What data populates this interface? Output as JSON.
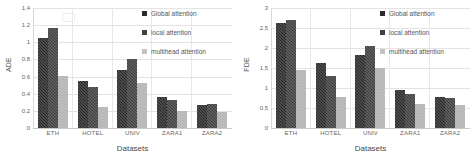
{
  "figure": {
    "legend": [
      {
        "name": "global-attention",
        "label": "Global attention",
        "color": "#2a2a2a"
      },
      {
        "name": "local-attention",
        "label": "local attention",
        "color": "#404040"
      },
      {
        "name": "multihead-attention",
        "label": "multihead attention",
        "color": "#c2c2c2"
      }
    ]
  },
  "chart_data": [
    {
      "type": "bar",
      "title": "",
      "xlabel": "Datasets",
      "ylabel": "ADE",
      "categories": [
        "ETH",
        "HOTEL",
        "UNIV",
        "ZARA1",
        "ZARA2"
      ],
      "series": [
        {
          "name": "Global attention",
          "values": [
            1.05,
            0.55,
            0.68,
            0.36,
            0.27
          ]
        },
        {
          "name": "local attention",
          "values": [
            1.17,
            0.48,
            0.8,
            0.33,
            0.28
          ]
        },
        {
          "name": "multihead attention",
          "values": [
            0.61,
            0.24,
            0.52,
            0.2,
            0.19
          ]
        }
      ],
      "ylim": [
        0,
        1.4
      ],
      "yticks": [
        "0",
        "0.2",
        "0.4",
        "0.6",
        "0.8",
        "1",
        "1.2",
        "1.4"
      ],
      "ytick_values": [
        0,
        0.2,
        0.4,
        0.6,
        0.8,
        1.0,
        1.2,
        1.4
      ],
      "grid": true,
      "legend_position": "top-right"
    },
    {
      "type": "bar",
      "title": "",
      "xlabel": "Datasets",
      "ylabel": "FDE",
      "categories": [
        "ETH",
        "HOTEL",
        "UNIV",
        "ZARA1",
        "ZARA2"
      ],
      "series": [
        {
          "name": "Global attention",
          "values": [
            2.62,
            1.62,
            1.83,
            0.96,
            0.77
          ]
        },
        {
          "name": "local attention",
          "values": [
            2.7,
            1.31,
            2.05,
            0.84,
            0.75
          ]
        },
        {
          "name": "multihead attention",
          "values": [
            1.46,
            0.78,
            1.51,
            0.61,
            0.58
          ]
        }
      ],
      "ylim": [
        0,
        3
      ],
      "yticks": [
        "0",
        "0.5",
        "1",
        "1.5",
        "2",
        "2.5",
        "3"
      ],
      "ytick_values": [
        0,
        0.5,
        1.0,
        1.5,
        2.0,
        2.5,
        3.0
      ],
      "grid": true,
      "legend_position": "top-right"
    }
  ]
}
